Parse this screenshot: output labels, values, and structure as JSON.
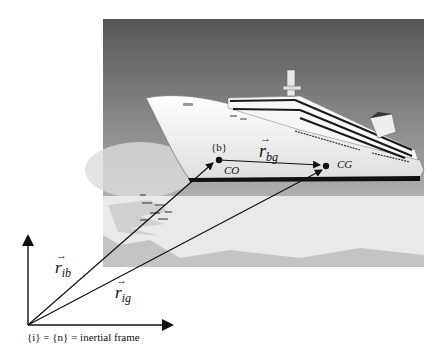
{
  "diagram": {
    "background_image": {
      "subject": "cruise-ship-on-water",
      "tone": "grayscale"
    },
    "frames": {
      "inertial": {
        "caption": "{i} = {n} = inertial frame"
      },
      "body": {
        "label": "{b}"
      }
    },
    "points": {
      "co": {
        "label": "CO"
      },
      "cg": {
        "label": "CG"
      }
    },
    "vectors": {
      "r_ib": {
        "symbol": "r",
        "subscript": "ib",
        "arrow": "→"
      },
      "r_ig": {
        "symbol": "r",
        "subscript": "ig",
        "arrow": "→"
      },
      "r_bg": {
        "symbol": "r",
        "subscript": "bg",
        "arrow": "→"
      }
    },
    "colors": {
      "sky_top": "#5a5a5a",
      "sky_bottom": "#cfcfcf",
      "hull": "#f2f2f2",
      "water": "#bdbdbd",
      "ink": "#111111"
    }
  }
}
